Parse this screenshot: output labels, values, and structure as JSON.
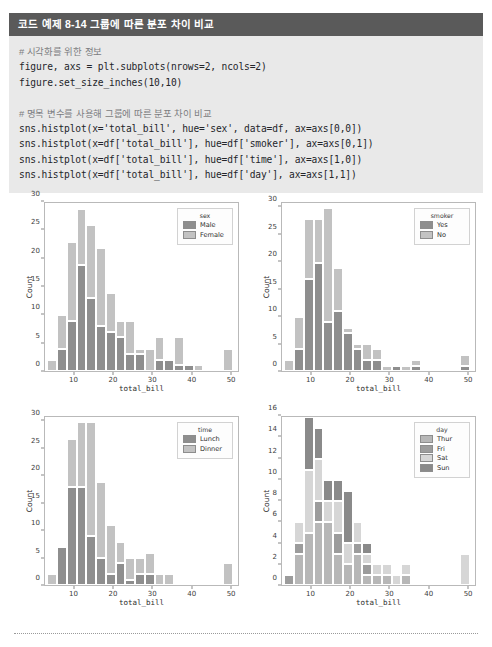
{
  "code_example": {
    "header": "코드 예제 8-14  그룹에 따른 분포 차이 비교",
    "lines": [
      {
        "text": "# 시각화를 위한 정보",
        "kind": "comment"
      },
      {
        "text": "figure, axs = plt.subplots(nrows=2, ncols=2)",
        "kind": "code"
      },
      {
        "text": "figure.set_size_inches(10,10)",
        "kind": "code"
      },
      {
        "text": "",
        "kind": "blank"
      },
      {
        "text": "# 명목 변수를 사용해 그룹에 따른 분포 차이 비교",
        "kind": "comment"
      },
      {
        "text": "sns.histplot(x='total_bill', hue='sex', data=df, ax=axs[0,0])",
        "kind": "code"
      },
      {
        "text": "sns.histplot(x=df['total_bill'], hue=df['smoker'], ax=axs[0,1])",
        "kind": "code"
      },
      {
        "text": "sns.histplot(x=df['total_bill'], hue=df['time'], ax=axs[1,0])",
        "kind": "code"
      },
      {
        "text": "sns.histplot(x=df['total_bill'], hue=df['day'], ax=axs[1,1])",
        "kind": "code"
      }
    ]
  },
  "colors": {
    "header_bg": "#5a5a5a",
    "code_bg": "#e9e9e9",
    "series_dark": "#8e8e8e",
    "series_light": "#c2c2c2",
    "series_mid": "#a8a8a8",
    "series_pale": "#d6d6d6",
    "axis": "#b9b9b9"
  },
  "chart_data": [
    {
      "id": "sex",
      "type": "bar",
      "subtype": "stacked-histogram",
      "title": "",
      "xlabel": "total_bill",
      "ylabel": "Count",
      "legend_title": "sex",
      "legend_position": "upper right",
      "grid": false,
      "xlim": [
        2.5,
        52.0
      ],
      "ylim": [
        0,
        30
      ],
      "xticks": [
        10,
        20,
        30,
        40,
        50
      ],
      "yticks": [
        0,
        5,
        10,
        15,
        20,
        25,
        30
      ],
      "bin_edges": [
        3.1,
        5.6,
        8.1,
        10.6,
        13.1,
        15.6,
        18.1,
        20.6,
        23.1,
        25.6,
        28.1,
        30.6,
        33.1,
        35.6,
        38.1,
        40.6,
        43.1,
        45.6,
        48.1,
        50.6
      ],
      "series": [
        {
          "name": "Male",
          "color": "#8e8e8e",
          "values": [
            0,
            4,
            9,
            19,
            13,
            8,
            7,
            6,
            3,
            3,
            0,
            2,
            2,
            1,
            1,
            0,
            0,
            0,
            0
          ]
        },
        {
          "name": "Female",
          "color": "#c2c2c2",
          "values": [
            2,
            6,
            14,
            10,
            13,
            14,
            7,
            3,
            6,
            1,
            4,
            4,
            0,
            5,
            0,
            1,
            0,
            0,
            4
          ]
        }
      ],
      "totals": [
        2,
        10,
        23,
        29,
        26,
        22,
        14,
        9,
        9,
        4,
        4,
        6,
        2,
        6,
        1,
        1,
        0,
        0,
        4
      ]
    },
    {
      "id": "smoker",
      "type": "bar",
      "subtype": "stacked-histogram",
      "title": "",
      "xlabel": "total_bill",
      "ylabel": "Count",
      "legend_title": "smoker",
      "legend_position": "upper right",
      "grid": false,
      "xlim": [
        2.5,
        52.0
      ],
      "ylim": [
        0,
        31
      ],
      "xticks": [
        10,
        20,
        30,
        40,
        50
      ],
      "yticks": [
        0,
        5,
        10,
        15,
        20,
        25,
        30
      ],
      "bin_edges": [
        3.1,
        5.6,
        8.1,
        10.6,
        13.1,
        15.6,
        18.1,
        20.6,
        23.1,
        25.6,
        28.1,
        30.6,
        33.1,
        35.6,
        38.1,
        40.6,
        43.1,
        45.6,
        48.1,
        50.6
      ],
      "series": [
        {
          "name": "Yes",
          "color": "#8e8e8e",
          "values": [
            0,
            4,
            17,
            20,
            9,
            11,
            7,
            4,
            2,
            2,
            0,
            1,
            0,
            1,
            0,
            0,
            0,
            0,
            1
          ]
        },
        {
          "name": "No",
          "color": "#c2c2c2",
          "values": [
            2,
            6,
            11,
            8,
            21,
            8,
            1,
            1,
            3,
            2,
            1,
            0,
            1,
            1,
            0,
            0,
            0,
            0,
            2
          ]
        }
      ],
      "totals": [
        2,
        10,
        28,
        28,
        30,
        19,
        8,
        5,
        5,
        4,
        1,
        1,
        1,
        2,
        0,
        0,
        0,
        0,
        3
      ]
    },
    {
      "id": "time",
      "type": "bar",
      "subtype": "stacked-histogram",
      "title": "",
      "xlabel": "total_bill",
      "ylabel": "Count",
      "legend_title": "time",
      "legend_position": "upper right",
      "grid": false,
      "xlim": [
        2.5,
        52.0
      ],
      "ylim": [
        0,
        31
      ],
      "xticks": [
        10,
        20,
        30,
        40,
        50
      ],
      "yticks": [
        0,
        5,
        10,
        15,
        20,
        25,
        30
      ],
      "bin_edges": [
        3.1,
        5.6,
        8.1,
        10.6,
        13.1,
        15.6,
        18.1,
        20.6,
        23.1,
        25.6,
        28.1,
        30.6,
        33.1,
        35.6,
        38.1,
        40.6,
        43.1,
        45.6,
        48.1,
        50.6
      ],
      "series": [
        {
          "name": "Lunch",
          "color": "#8e8e8e",
          "values": [
            0,
            7,
            18,
            18,
            9,
            5,
            2,
            4,
            1,
            2,
            2,
            0,
            0,
            0,
            0,
            0,
            0,
            0,
            0
          ]
        },
        {
          "name": "Dinner",
          "color": "#c2c2c2",
          "values": [
            2,
            0,
            9,
            12,
            21,
            14,
            9,
            4,
            4,
            3,
            4,
            2,
            2,
            0,
            0,
            0,
            0,
            0,
            4
          ]
        }
      ],
      "totals": [
        2,
        7,
        27,
        30,
        30,
        25,
        19,
        11,
        8,
        5,
        6,
        2,
        2,
        0,
        0,
        0,
        0,
        0,
        4
      ]
    },
    {
      "id": "day",
      "type": "bar",
      "subtype": "stacked-histogram",
      "title": "",
      "xlabel": "total_bill",
      "ylabel": "Count",
      "legend_title": "day",
      "legend_position": "upper right",
      "grid": false,
      "xlim": [
        2.5,
        52.0
      ],
      "ylim": [
        0,
        16
      ],
      "xticks": [
        10,
        20,
        30,
        40,
        50
      ],
      "yticks": [
        0,
        2,
        4,
        6,
        8,
        10,
        12,
        14,
        16
      ],
      "bin_edges": [
        3.1,
        5.6,
        8.1,
        10.6,
        13.1,
        15.6,
        18.1,
        20.6,
        23.1,
        25.6,
        28.1,
        30.6,
        33.1,
        35.6,
        38.1,
        40.6,
        43.1,
        45.6,
        48.1,
        50.6
      ],
      "series": [
        {
          "name": "Thur",
          "color": "#b7b7b7",
          "values": [
            0,
            3,
            5,
            6,
            6,
            3,
            2,
            3,
            1,
            1,
            1,
            0,
            1,
            0,
            0,
            0,
            0,
            0,
            0
          ]
        },
        {
          "name": "Fri",
          "color": "#9c9c9c",
          "values": [
            1,
            1,
            0,
            2,
            0,
            2,
            0,
            1,
            1,
            0,
            0,
            0,
            0,
            0,
            0,
            0,
            0,
            0,
            0
          ]
        },
        {
          "name": "Sat",
          "color": "#d6d6d6",
          "values": [
            0,
            2,
            6,
            4,
            2,
            3,
            2,
            2,
            1,
            1,
            1,
            1,
            1,
            0,
            0,
            0,
            0,
            0,
            3
          ]
        },
        {
          "name": "Sun",
          "color": "#8a8a8a",
          "values": [
            0,
            0,
            5,
            3,
            2,
            2,
            5,
            0,
            1,
            0,
            0,
            0,
            0,
            0,
            0,
            0,
            0,
            0,
            0
          ]
        }
      ],
      "totals": [
        1,
        6,
        16,
        15,
        10,
        10,
        9,
        6,
        4,
        2,
        2,
        1,
        2,
        0,
        0,
        0,
        0,
        0,
        3
      ]
    }
  ]
}
